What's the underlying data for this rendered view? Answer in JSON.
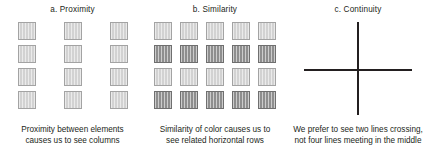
{
  "figure": {
    "background_color": "#ffffff",
    "text_color": "#231f20",
    "panels": [
      {
        "id": "a",
        "title": "a.  Proximity",
        "caption_line1": "Proximity between elements",
        "caption_line2": "causes us to see columns",
        "grid": {
          "columns": 3,
          "rows": 4,
          "square_fill_light": "#d2d2d2",
          "square_border": "#a3a3a3",
          "row_shades": [
            "light",
            "light",
            "light",
            "light"
          ]
        }
      },
      {
        "id": "b",
        "title": "b.  Similarity",
        "caption_line1": "Similarity of color causes us to",
        "caption_line2": "see related horizontal rows",
        "grid": {
          "columns": 5,
          "rows": 4,
          "square_fill_light": "#d2d2d2",
          "square_fill_dark": "#8e8e8e",
          "square_border_light": "#a3a3a3",
          "square_border_dark": "#6f6f6f",
          "row_shades": [
            "light",
            "dark",
            "light",
            "dark"
          ]
        }
      },
      {
        "id": "c",
        "title": "c.  Continuity",
        "caption_line1": "We prefer to see two lines crossing,",
        "caption_line2": "not four lines meeting in the middle",
        "cross": {
          "line_color": "#231f20",
          "vertical_thickness_px": 2,
          "horizontal_thickness_px": 2
        }
      }
    ]
  }
}
